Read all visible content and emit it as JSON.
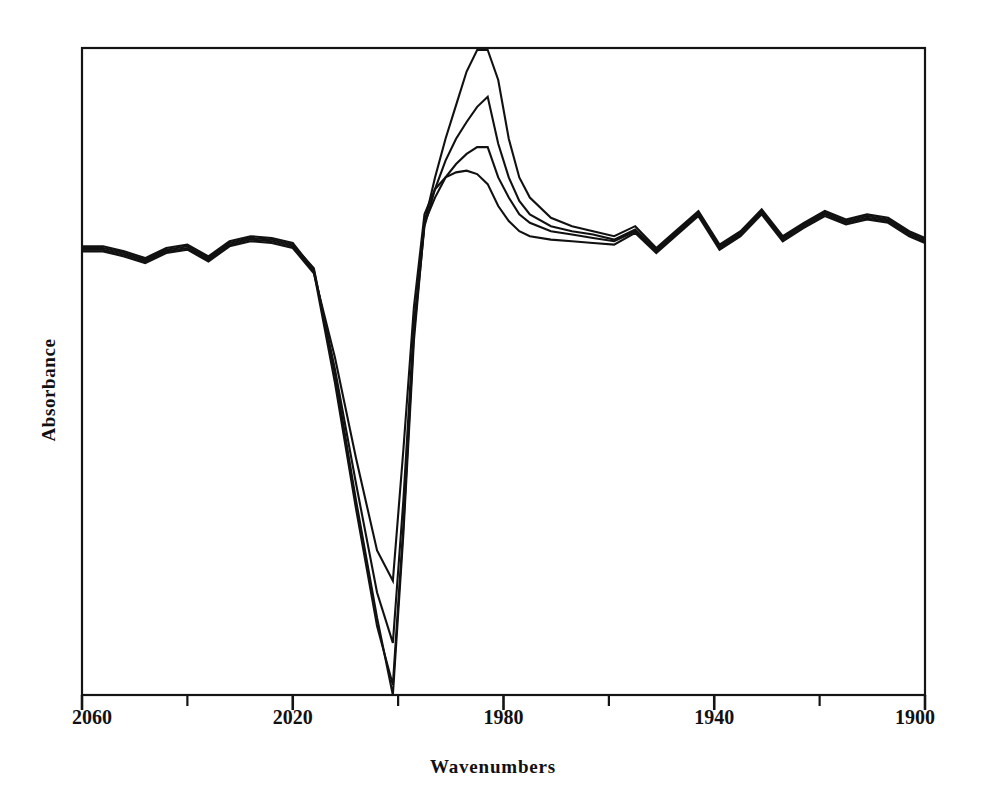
{
  "chart_data": {
    "type": "line",
    "title": "",
    "xlabel": "Wavenumbers",
    "ylabel": "Absorbance",
    "xlim": [
      2060,
      1900
    ],
    "x_axis_inverted": true,
    "x_major_ticks": [
      2060,
      2020,
      1980,
      1940,
      1900
    ],
    "x_minor_ticks": [
      2040,
      2000,
      1960,
      1920
    ],
    "x_tick_labels": [
      "2060",
      "2020",
      "1980",
      "1940",
      "1900"
    ],
    "y_axis_ticks_shown": false,
    "ylim_note": "Absorbance axis unlabeled (arbitrary units)",
    "grid": false,
    "legend": false,
    "frame": "box",
    "line_color": "#111111",
    "background_color": "#ffffff",
    "x": [
      2060,
      2056,
      2052,
      2048,
      2044,
      2040,
      2036,
      2032,
      2028,
      2024,
      2020,
      2016,
      2012,
      2008,
      2004,
      2001,
      1999,
      1997,
      1995,
      1993,
      1991,
      1989,
      1987,
      1985,
      1983,
      1981,
      1979,
      1977,
      1975,
      1971,
      1967,
      1963,
      1959,
      1955,
      1951,
      1947,
      1943,
      1939,
      1935,
      1931,
      1927,
      1923,
      1919,
      1915,
      1911,
      1907,
      1903,
      1900
    ],
    "series": [
      {
        "name": "spectrum-1",
        "label": "largest positive band",
        "values": [
          0.2,
          0.2,
          0.17,
          0.13,
          0.19,
          0.21,
          0.14,
          0.23,
          0.26,
          0.25,
          0.22,
          0.08,
          -0.55,
          -1.3,
          -2.0,
          -2.46,
          -1.5,
          -0.35,
          0.35,
          0.62,
          0.85,
          1.05,
          1.25,
          1.45,
          1.62,
          1.2,
          0.85,
          0.62,
          0.5,
          0.38,
          0.33,
          0.3,
          0.27,
          0.33,
          0.2,
          0.31,
          0.42,
          0.22,
          0.3,
          0.43,
          0.27,
          0.35,
          0.42,
          0.37,
          0.4,
          0.38,
          0.3,
          0.26
        ]
      },
      {
        "name": "spectrum-2",
        "label": "second positive band",
        "values": [
          0.19,
          0.19,
          0.16,
          0.12,
          0.18,
          0.2,
          0.13,
          0.22,
          0.25,
          0.24,
          0.21,
          0.06,
          -0.6,
          -1.35,
          -2.05,
          -2.4,
          -1.45,
          -0.3,
          0.33,
          0.55,
          0.72,
          0.85,
          0.95,
          1.04,
          1.1,
          0.82,
          0.62,
          0.48,
          0.4,
          0.33,
          0.3,
          0.28,
          0.25,
          0.31,
          0.19,
          0.3,
          0.41,
          0.21,
          0.29,
          0.42,
          0.26,
          0.34,
          0.41,
          0.36,
          0.39,
          0.37,
          0.29,
          0.25
        ]
      },
      {
        "name": "spectrum-3",
        "label": "third positive band",
        "values": [
          0.21,
          0.21,
          0.18,
          0.14,
          0.2,
          0.22,
          0.15,
          0.24,
          0.27,
          0.26,
          0.23,
          0.07,
          -0.52,
          -1.2,
          -1.85,
          -2.15,
          -1.3,
          -0.25,
          0.35,
          0.5,
          0.62,
          0.7,
          0.76,
          0.8,
          0.8,
          0.62,
          0.5,
          0.4,
          0.35,
          0.3,
          0.28,
          0.26,
          0.24,
          0.3,
          0.18,
          0.29,
          0.4,
          0.2,
          0.28,
          0.41,
          0.25,
          0.33,
          0.4,
          0.35,
          0.38,
          0.36,
          0.28,
          0.24
        ]
      },
      {
        "name": "spectrum-4",
        "label": "smallest positive band",
        "values": [
          0.18,
          0.18,
          0.15,
          0.11,
          0.17,
          0.19,
          0.12,
          0.21,
          0.24,
          0.23,
          0.2,
          0.05,
          -0.45,
          -1.05,
          -1.6,
          -1.78,
          -1.0,
          -0.15,
          0.4,
          0.55,
          0.62,
          0.65,
          0.66,
          0.64,
          0.58,
          0.45,
          0.36,
          0.3,
          0.27,
          0.25,
          0.24,
          0.23,
          0.22,
          0.29,
          0.17,
          0.28,
          0.39,
          0.19,
          0.27,
          0.4,
          0.24,
          0.32,
          0.39,
          0.34,
          0.37,
          0.35,
          0.27,
          0.23
        ]
      }
    ]
  },
  "axes": {
    "xlabel": "Wavenumbers",
    "ylabel": "Absorbance",
    "tick_labels": [
      "2060",
      "2020",
      "1980",
      "1940",
      "1900"
    ]
  }
}
